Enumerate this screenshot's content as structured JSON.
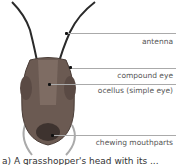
{
  "diagram": {
    "labels": [
      {
        "id": "antenna",
        "text": "antenna"
      },
      {
        "id": "compound-eye",
        "text": "compound eye"
      },
      {
        "id": "ocellus",
        "text": "ocellus (simple eye)"
      },
      {
        "id": "mouthparts",
        "text": "chewing mouthparts"
      }
    ],
    "caption": "a) A grasshopper's head with its ..."
  }
}
